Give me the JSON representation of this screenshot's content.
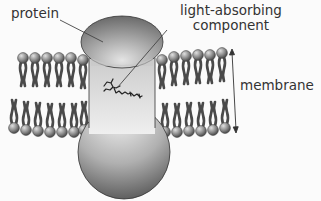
{
  "figure": {
    "labels": {
      "protein": "protein",
      "light_absorbing_line1": "light-absorbing",
      "light_absorbing_line2": "component",
      "membrane": "membrane"
    },
    "colors": {
      "background": "#fbfbfb",
      "text": "#333333",
      "protein_light": "#e8e8e8",
      "protein_dark": "#6a6a6a",
      "lipid_head": "#8a8a8a",
      "lipid_tail": "#555555",
      "leader_line": "#444444"
    },
    "membrane": {
      "left_heads_per_leaflet": 7,
      "right_heads_per_leaflet": 7
    }
  }
}
